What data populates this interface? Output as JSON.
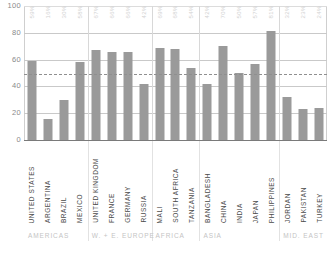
{
  "chart_data": {
    "type": "bar",
    "title": "",
    "subtitle": "",
    "xlabel": "",
    "ylabel": "",
    "ylim": [
      0,
      100
    ],
    "yticks": [
      0,
      20,
      40,
      60,
      80,
      100
    ],
    "grid": true,
    "legend": null,
    "reference_line": {
      "value": 49,
      "style": "dashed",
      "label": ""
    },
    "categories": [
      "UNITED STATES",
      "ARGENTINA",
      "BRAZIL",
      "MEXICO",
      "UNITED KINGDOM",
      "FRANCE",
      "GERMANY",
      "RUSSIA",
      "MALI",
      "SOUTH AFRICA",
      "TANZANIA",
      "BANGLADESH",
      "CHINA",
      "INDIA",
      "JAPAN",
      "PHILIPPINES",
      "JORDAN",
      "PAKISTAN",
      "TURKEY"
    ],
    "values": [
      59,
      16,
      30,
      58,
      67,
      66,
      66,
      42,
      69,
      68,
      54,
      42,
      70,
      50,
      57,
      81,
      32,
      23,
      24
    ],
    "data_labels": [
      "59%",
      "16%",
      "30%",
      "58%",
      "67%",
      "66%",
      "66%",
      "42%",
      "69%",
      "68%",
      "54%",
      "42%",
      "70%",
      "50%",
      "57%",
      "81%",
      "32%",
      "23%",
      "24%"
    ],
    "groups": [
      {
        "label": "AMERICAS",
        "start": 0,
        "count": 4
      },
      {
        "label": "W. + E. EUROPE",
        "start": 4,
        "count": 4
      },
      {
        "label": "AFRICA",
        "start": 8,
        "count": 3
      },
      {
        "label": "ASIA",
        "start": 11,
        "count": 5
      },
      {
        "label": "MID. EAST",
        "start": 16,
        "count": 3
      }
    ],
    "colors": {
      "bar": "#9a9a9a",
      "grid": "#c9c9c9",
      "reference_line": "#8f8f8f",
      "tick_label": "#8a8a8a",
      "category_label": "#4a4a4a",
      "group_label": "#c4c4c4",
      "background": "#ffffff"
    }
  }
}
